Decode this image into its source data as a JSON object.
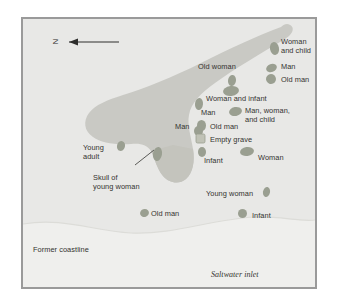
{
  "figure": {
    "kind": "archaeological-site-map",
    "background_color": "#ffffff",
    "frame_border_color": "#9a9a9a"
  },
  "map": {
    "land_color": "#c9c9c4",
    "headland_color": "#c4c4bd",
    "water_color": "#eeeeec",
    "grave_color": "#9a9f91",
    "empty_grave_color": "#c0c2b6",
    "text_color": "#33322f",
    "compass": {
      "letter": "N",
      "direction": "west-arrow",
      "arrow_name": "north-arrow"
    },
    "terrain_labels": [
      {
        "id": "former-coastline",
        "text": "Former coastline",
        "style": "plain",
        "x": 10,
        "y": 227,
        "align": "left"
      },
      {
        "id": "saltwater-inlet",
        "text": "Saltwater inlet",
        "style": "italic",
        "x": 188,
        "y": 252,
        "align": "left"
      }
    ],
    "burials": [
      {
        "id": "woman-and-child",
        "label": "Woman\nand child",
        "label_x": 258,
        "label_y": 19,
        "align": "left",
        "marker_x": 247,
        "marker_y": 23,
        "marker_w": 9,
        "marker_h": 13,
        "marker_rot": -12,
        "marker_type": "oval"
      },
      {
        "id": "man-upper-right",
        "label": "Man",
        "label_x": 258,
        "label_y": 44,
        "align": "left",
        "marker_x": 243,
        "marker_y": 45,
        "marker_w": 11,
        "marker_h": 8,
        "marker_rot": -20,
        "marker_type": "oval"
      },
      {
        "id": "old-man-upper-right",
        "label": "Old man",
        "label_x": 258,
        "label_y": 57,
        "align": "left",
        "marker_x": 243,
        "marker_y": 55,
        "marker_w": 10,
        "marker_h": 10,
        "marker_rot": -25,
        "marker_type": "oval"
      },
      {
        "id": "old-woman",
        "label": "Old woman",
        "label_x": 175,
        "label_y": 44,
        "align": "left",
        "marker_x": 205,
        "marker_y": 56,
        "marker_w": 8,
        "marker_h": 11,
        "marker_rot": 8,
        "marker_type": "oval"
      },
      {
        "id": "woman-and-infant",
        "label": "Woman and infant",
        "label_x": 183,
        "label_y": 76,
        "align": "left",
        "marker_x": 200,
        "marker_y": 67,
        "marker_w": 16,
        "marker_h": 10,
        "marker_rot": -8,
        "marker_type": "oval"
      },
      {
        "id": "man-mid-upper",
        "label": "Man",
        "label_x": 178,
        "label_y": 90,
        "align": "left",
        "marker_x": 172,
        "marker_y": 79,
        "marker_w": 8,
        "marker_h": 12,
        "marker_rot": 5,
        "marker_type": "oval"
      },
      {
        "id": "man-woman-and-child",
        "label": "Man, woman,\nand child",
        "label_x": 222,
        "label_y": 88,
        "align": "left",
        "marker_x": 206,
        "marker_y": 88,
        "marker_w": 13,
        "marker_h": 9,
        "marker_rot": -10,
        "marker_type": "oval"
      },
      {
        "id": "old-man-center",
        "label": "Old man",
        "label_x": 187,
        "label_y": 104,
        "align": "left",
        "marker_x": 174,
        "marker_y": 101,
        "marker_w": 9,
        "marker_h": 11,
        "marker_rot": 0,
        "marker_type": "oval"
      },
      {
        "id": "man-left-center",
        "label": "Man",
        "label_x": 152,
        "label_y": 104,
        "align": "left",
        "marker_x": 171,
        "marker_y": 107,
        "marker_w": 9,
        "marker_h": 10,
        "marker_rot": 0,
        "marker_type": "oval"
      },
      {
        "id": "empty-grave",
        "label": "Empty grave",
        "label_x": 187,
        "label_y": 117,
        "align": "left",
        "marker_x": 173,
        "marker_y": 115,
        "marker_w": 9,
        "marker_h": 9,
        "marker_rot": 0,
        "marker_type": "square"
      },
      {
        "id": "infant-center",
        "label": "Infant",
        "label_x": 181,
        "label_y": 138,
        "align": "left",
        "marker_x": 175,
        "marker_y": 128,
        "marker_w": 8,
        "marker_h": 10,
        "marker_rot": 0,
        "marker_type": "oval"
      },
      {
        "id": "woman-right",
        "label": "Woman",
        "label_x": 235,
        "label_y": 135,
        "align": "left",
        "marker_x": 217,
        "marker_y": 128,
        "marker_w": 14,
        "marker_h": 9,
        "marker_rot": -8,
        "marker_type": "oval"
      },
      {
        "id": "young-adult",
        "label": "Young\nadult",
        "label_x": 60,
        "label_y": 125,
        "align": "left",
        "marker_x": 94,
        "marker_y": 122,
        "marker_w": 8,
        "marker_h": 10,
        "marker_rot": 15,
        "marker_type": "oval"
      },
      {
        "id": "skull-of-young-woman",
        "label": "Skull of\nyoung woman",
        "label_x": 70,
        "label_y": 155,
        "align": "left",
        "marker_x": 130,
        "marker_y": 128,
        "marker_w": 9,
        "marker_h": 14,
        "marker_rot": 10,
        "marker_type": "oval",
        "leader_line": true
      },
      {
        "id": "young-woman",
        "label": "Young woman",
        "label_x": 183,
        "label_y": 171,
        "align": "left",
        "marker_x": 240,
        "marker_y": 168,
        "marker_w": 7,
        "marker_h": 10,
        "marker_rot": 12,
        "marker_type": "oval"
      },
      {
        "id": "old-man-lower",
        "label": "Old man",
        "label_x": 128,
        "label_y": 191,
        "align": "left",
        "marker_x": 117,
        "marker_y": 190,
        "marker_w": 9,
        "marker_h": 8,
        "marker_rot": -20,
        "marker_type": "oval"
      },
      {
        "id": "infant-lower",
        "label": "Infant",
        "label_x": 229,
        "label_y": 193,
        "align": "left",
        "marker_x": 215,
        "marker_y": 190,
        "marker_w": 9,
        "marker_h": 9,
        "marker_rot": 0,
        "marker_type": "oval"
      }
    ]
  }
}
